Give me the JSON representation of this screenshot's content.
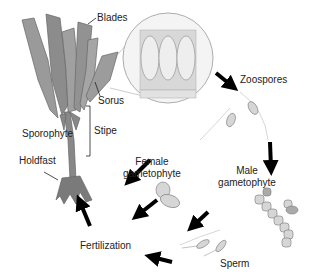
{
  "diagram": {
    "labels": {
      "blades": "Blades",
      "sorus": "Sorus",
      "stipe": "Stipe",
      "sporophyte": "Sporophyte",
      "holdfast": "Holdfast",
      "zoospores": "Zoospores",
      "female_gametophyte_1": "Female",
      "female_gametophyte_2": "gametophyte",
      "male_gametophyte_1": "Male",
      "male_gametophyte_2": "gametophyte",
      "sperm": "Sperm",
      "fertilization": "Fertilization"
    },
    "colors": {
      "kelp": "#8a8a8a",
      "kelp_light": "#b5b5b5",
      "arrow": "#000000",
      "cell": "#d0d0d0",
      "text": "#222222"
    },
    "cycle": [
      "Sporophyte",
      "Zoospores",
      "Male gametophyte",
      "Sperm",
      "Fertilization",
      "Female gametophyte"
    ]
  }
}
